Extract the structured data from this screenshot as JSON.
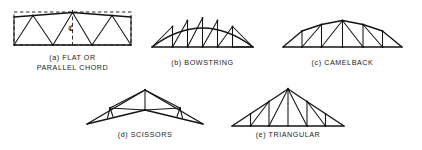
{
  "figure": {
    "background_color": "#ffffff",
    "line_color": "#141414",
    "width": 422,
    "height": 150
  },
  "trusses": [
    {
      "id": "flat-parallel-chord",
      "letter": "(a)",
      "caption": "(a) FLAT OR\nPARALLEL CHORD",
      "caption_line_1": "(a) FLAT OR",
      "caption_line_2": "PARALLEL CHORD",
      "has_dashed_box": true,
      "has_centerline": true,
      "centerline_symbol": "℄"
    },
    {
      "id": "bowstring",
      "letter": "(b)",
      "caption": "(b) BOWSTRING",
      "has_dashed_box": false,
      "has_centerline": false
    },
    {
      "id": "camelback",
      "letter": "(c)",
      "caption": "(c) CAMELBACK",
      "has_dashed_box": false,
      "has_centerline": false
    },
    {
      "id": "scissors",
      "letter": "(d)",
      "caption": "(d) SCISSORS",
      "has_dashed_box": false,
      "has_centerline": false
    },
    {
      "id": "triangular",
      "letter": "(e)",
      "caption": "(e) TRIANGULAR",
      "has_dashed_box": false,
      "has_centerline": false
    }
  ]
}
